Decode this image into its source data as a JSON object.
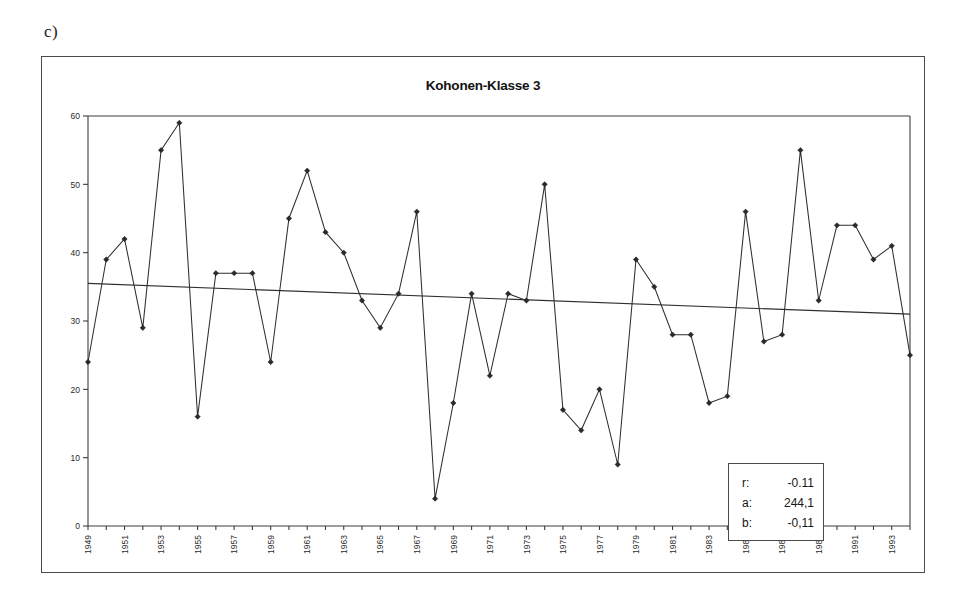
{
  "figure": {
    "label": "c)"
  },
  "chart_data": {
    "type": "line",
    "title": "Kohonen-Klasse 3",
    "xlabel": "",
    "ylabel": "",
    "ylim": [
      0,
      60
    ],
    "yticks": [
      0,
      10,
      20,
      30,
      40,
      50,
      60
    ],
    "ytick_labels": [
      "0",
      "10",
      "20",
      "30",
      "40",
      "50",
      "60"
    ],
    "grid": false,
    "legend_position": "none",
    "x_tick_label_step": 2,
    "x_tick_labels": [
      "1949",
      "1951",
      "1953",
      "1955",
      "1957",
      "1959",
      "1961",
      "1963",
      "1965",
      "1967",
      "1969",
      "1971",
      "1973",
      "1975",
      "1977",
      "1979",
      "1981",
      "1983",
      "1985",
      "1987",
      "1989",
      "1991",
      "1993"
    ],
    "x": [
      1949,
      1950,
      1951,
      1952,
      1953,
      1954,
      1955,
      1956,
      1957,
      1958,
      1959,
      1960,
      1961,
      1962,
      1963,
      1964,
      1965,
      1966,
      1967,
      1968,
      1969,
      1970,
      1971,
      1972,
      1973,
      1974,
      1975,
      1976,
      1977,
      1978,
      1979,
      1980,
      1981,
      1982,
      1983,
      1984,
      1985,
      1986,
      1987,
      1988,
      1989,
      1990,
      1991,
      1992,
      1993,
      1994
    ],
    "series": [
      {
        "name": "Kohonen-Klasse 3",
        "marker": "diamond",
        "values": [
          24,
          39,
          42,
          29,
          55,
          59,
          16,
          37,
          37,
          37,
          24,
          45,
          52,
          43,
          40,
          33,
          29,
          34,
          46,
          4,
          18,
          34,
          22,
          34,
          33,
          50,
          17,
          14,
          20,
          9,
          39,
          35,
          28,
          28,
          18,
          19,
          46,
          27,
          28,
          55,
          33,
          44,
          44,
          39,
          41,
          25
        ]
      },
      {
        "name": "Trend",
        "marker": "none",
        "type": "trend",
        "start_value": 35.5,
        "end_value": 31.0
      }
    ],
    "annotations": {
      "stats": [
        {
          "key": "r:",
          "value": "-0.11"
        },
        {
          "key": "a:",
          "value": "244,1"
        },
        {
          "key": "b:",
          "value": "-0,11"
        }
      ]
    }
  },
  "colors": {
    "line": "#2f2f2f",
    "axis": "#3d3d3d",
    "frame": "#4a4a4a",
    "background": "#ffffff",
    "text": "#161616"
  }
}
